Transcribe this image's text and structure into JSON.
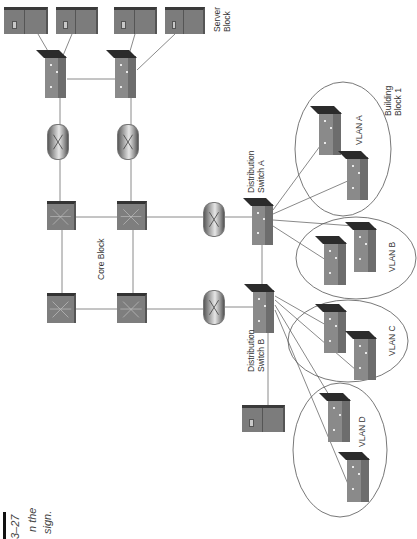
{
  "figure": {
    "caption_fragments": [
      "3–27",
      "n the",
      "sign."
    ],
    "orientation": "rotated 90° counter-clockwise"
  },
  "labels": {
    "server_block": [
      "Server",
      "Block"
    ],
    "core_block": "Core Block",
    "distribution_a": [
      "Distribution",
      "Switch A"
    ],
    "distribution_b": [
      "Distribution",
      "Switch B"
    ],
    "building_block": [
      "Building",
      "Block 1"
    ],
    "vlan_a": "VLAN A",
    "vlan_b": "VLAN B",
    "vlan_c": "VLAN C",
    "vlan_d": "VLAN D"
  },
  "nodes": {
    "servers": [
      "server-1",
      "server-2",
      "server-3",
      "server-4",
      "server-distribution-b"
    ],
    "server_switches": [
      "server-switch-1",
      "server-switch-2"
    ],
    "routers": [
      "router-server-1",
      "router-server-2",
      "router-dist-a",
      "router-dist-b"
    ],
    "core_switches": [
      "core-switch-1",
      "core-switch-2",
      "core-switch-3",
      "core-switch-4"
    ],
    "distribution_switches": [
      "distribution-switch-a",
      "distribution-switch-b"
    ],
    "access_switches": {
      "vlan_a": 2,
      "vlan_b": 2,
      "vlan_c": 2,
      "vlan_d": 2
    }
  },
  "colors": {
    "device_gray": "#7e7e7e",
    "device_top": "#2b2b2b",
    "line": "#8a8a8a",
    "ellipse": "#555555",
    "text": "#333333"
  }
}
